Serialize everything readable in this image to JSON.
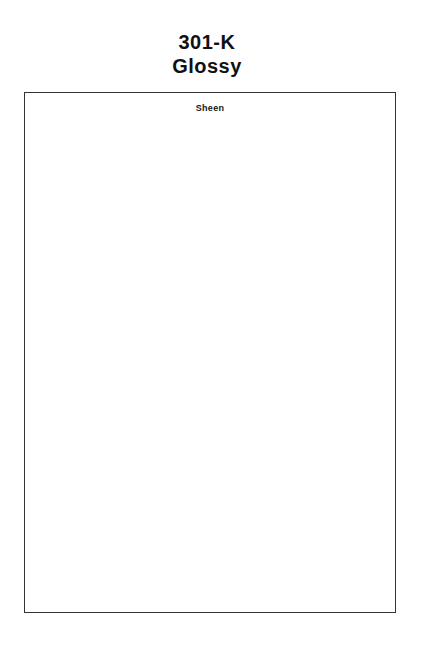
{
  "document": {
    "title_lines": [
      "301-K",
      "Glossy"
    ],
    "sample_label": "Sheen"
  },
  "colors": {
    "background": "#ffffff",
    "text": "#111111",
    "border": "#333333"
  }
}
